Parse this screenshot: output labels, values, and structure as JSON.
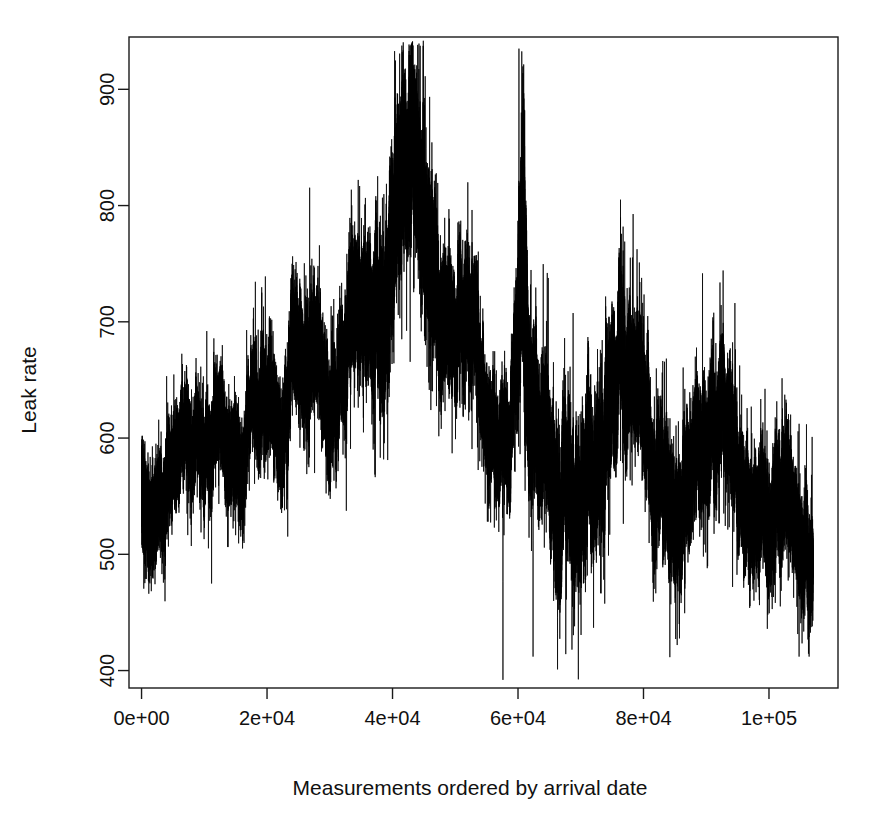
{
  "chart_data": {
    "type": "line",
    "title": "",
    "subtitle": "",
    "xlabel": "Measurements ordered by arrival date",
    "ylabel": "Leak rate",
    "xlim": [
      -2000,
      111000
    ],
    "ylim": [
      385,
      945
    ],
    "xticks": [
      0,
      20000,
      40000,
      60000,
      80000,
      100000
    ],
    "xticklabels": [
      "0e+00",
      "2e+04",
      "4e+04",
      "6e+04",
      "8e+04",
      "1e+05"
    ],
    "yticks": [
      400,
      500,
      600,
      700,
      800,
      900
    ],
    "yticklabels": [
      "400",
      "500",
      "600",
      "700",
      "800",
      "900"
    ],
    "grid": false,
    "legend": null,
    "series_color": "#000000",
    "n_points": 107000,
    "x_start": 0,
    "x_end": 107000,
    "observed_min": 390,
    "observed_max": 935,
    "envelope": {
      "comment": "Piecewise control points describing the local centre (mean) and local half-spread (noise amplitude) of the trace, read off the plot.",
      "x": [
        0,
        2000,
        5000,
        9000,
        13000,
        17000,
        21000,
        24000,
        26500,
        28500,
        30000,
        31500,
        33000,
        35000,
        37000,
        39000,
        40500,
        42000,
        43500,
        45000,
        46500,
        48000,
        50000,
        52000,
        53500,
        55000,
        57000,
        59000,
        60200,
        60800,
        61500,
        63000,
        65000,
        66500,
        68000,
        70000,
        72000,
        74000,
        76000,
        78000,
        80000,
        82000,
        84000,
        86000,
        88000,
        90000,
        92000,
        94000,
        96000,
        98000,
        100000,
        102000,
        104000,
        106000,
        107000
      ],
      "center": [
        585,
        578,
        572,
        582,
        590,
        598,
        612,
        640,
        672,
        690,
        660,
        648,
        672,
        690,
        712,
        760,
        800,
        788,
        812,
        800,
        760,
        712,
        690,
        700,
        672,
        648,
        632,
        628,
        700,
        820,
        660,
        590,
        540,
        508,
        495,
        520,
        552,
        580,
        596,
        600,
        588,
        566,
        548,
        560,
        572,
        580,
        572,
        556,
        540,
        532,
        520,
        536,
        520,
        500,
        492
      ],
      "spread": [
        40,
        38,
        36,
        36,
        38,
        38,
        42,
        44,
        48,
        46,
        42,
        44,
        50,
        52,
        58,
        66,
        72,
        70,
        72,
        70,
        62,
        54,
        48,
        50,
        46,
        42,
        40,
        44,
        80,
        115,
        80,
        55,
        58,
        60,
        58,
        58,
        56,
        58,
        56,
        54,
        52,
        52,
        50,
        50,
        50,
        50,
        48,
        48,
        48,
        46,
        44,
        46,
        44,
        44,
        42
      ]
    },
    "spikes": [
      {
        "x": 60150,
        "value": 935
      },
      {
        "x": 60950,
        "value": 873
      },
      {
        "x": 43200,
        "value": 898
      },
      {
        "x": 41800,
        "value": 880
      },
      {
        "x": 40900,
        "value": 872
      },
      {
        "x": 52000,
        "value": 820
      },
      {
        "x": 57600,
        "value": 392
      },
      {
        "x": 62400,
        "value": 412
      },
      {
        "x": 66300,
        "value": 401
      },
      {
        "x": 68600,
        "value": 418
      },
      {
        "x": 104800,
        "value": 412
      }
    ]
  },
  "axes": {
    "y_axis_name": "Leak rate",
    "x_axis_name": "Measurements ordered by arrival date"
  },
  "figure": {
    "background": "#ffffff",
    "foreground": "#000000",
    "width_px": 878,
    "height_px": 817
  }
}
